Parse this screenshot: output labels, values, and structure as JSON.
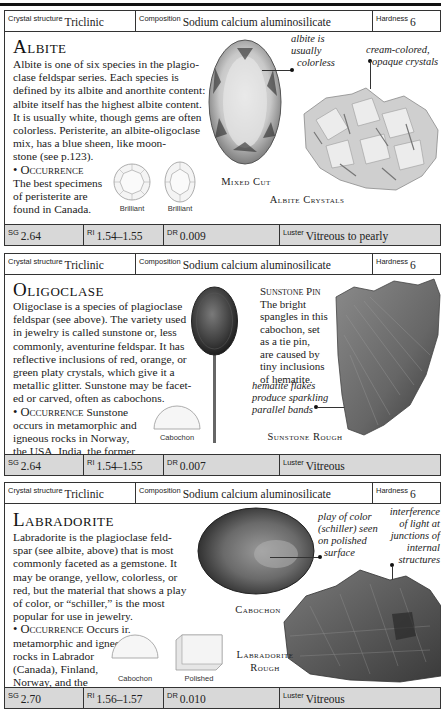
{
  "page": {
    "sections": [
      {
        "id": "albite",
        "title": "Albite",
        "header": {
          "crystal_structure_label": "Crystal structure",
          "crystal_structure": "Triclinic",
          "composition_label": "Composition",
          "composition": "Sodium calcium aluminosilicate",
          "hardness_label": "Hardness",
          "hardness": "6"
        },
        "body_lines": [
          "Albite is one of six species in the plagio-",
          "clase feldspar series. Each species is",
          "defined by its albite and anorthite content:",
          "albite itself has the highest albite content.",
          "It is usually white, though gems are often",
          "colorless. Peristerite, an albite-oligoclase",
          "mix, has a blue sheen, like moon-",
          "stone (see p.123)."
        ],
        "occurrence_label": "• Occurrence",
        "occurrence_lines": [
          "The best specimens",
          "of peristerite are",
          "found in Canada."
        ],
        "cut_labels": [
          "Brilliant",
          "Brilliant"
        ],
        "image_captions": [
          "Mixed Cut",
          "Albite Crystals"
        ],
        "annotations": [
          [
            "albite is",
            "usually",
            "colorless"
          ],
          [
            "cream-colored,",
            "opaque crystals"
          ]
        ],
        "footer": {
          "sg_label": "SG",
          "sg": "2.64",
          "ri_label": "RI",
          "ri": "1.54–1.55",
          "dr_label": "DR",
          "dr": "0.009",
          "luster_label": "Luster",
          "luster": "Vitreous to pearly"
        }
      },
      {
        "id": "oligoclase",
        "title": "Oligoclase",
        "header": {
          "crystal_structure_label": "Crystal structure",
          "crystal_structure": "Triclinic",
          "composition_label": "Composition",
          "composition": "Sodium calcium aluminosilicate",
          "hardness_label": "Hardness",
          "hardness": "6"
        },
        "body_lines": [
          "Oligoclase is a species of plagioclase",
          "feldspar (see above). The variety used",
          "in jewelry is called sunstone or, less",
          "commonly, aventurine feldspar. It has",
          "reflective inclusions of red, orange, or",
          "green platy crystals, which give it a",
          "metallic glitter. Sunstone may be facet-",
          "ed or carved, often as cabochons."
        ],
        "occurrence_label": "• Occurrence",
        "occurrence_first": "Sunstone",
        "occurrence_lines": [
          "occurs in metamorphic and",
          "igneous rocks in Norway,",
          "the USA, India, the former",
          "USSR, and Canada."
        ],
        "cut_labels": [
          "Cabochon"
        ],
        "side_caption_title": "Sunstone Pin",
        "side_caption_lines": [
          "The bright",
          "spangles in this",
          "cabochon, set",
          "as a tie pin,",
          "are caused by",
          "tiny inclusions",
          "of hematite."
        ],
        "image_captions": [
          "Sunstone Rough"
        ],
        "annotations": [
          [
            "hematite flakes",
            "produce sparkling",
            "parallel bands"
          ]
        ],
        "footer": {
          "sg_label": "SG",
          "sg": "2.64",
          "ri_label": "RI",
          "ri": "1.54–1.55",
          "dr_label": "DR",
          "dr": "0.007",
          "luster_label": "Luster",
          "luster": "Vitreous"
        }
      },
      {
        "id": "labradorite",
        "title": "Labradorite",
        "header": {
          "crystal_structure_label": "Crystal structure",
          "crystal_structure": "Triclinic",
          "composition_label": "Composition",
          "composition": "Sodium calcium aluminosilicate",
          "hardness_label": "Hardness",
          "hardness": "6"
        },
        "body_lines": [
          "Labradorite is the plagioclase feld-",
          "spar (see albite, above) that is most",
          "commonly faceted as a gemstone. It",
          "may be orange, yellow, colorless, or",
          "red, but the material that shows a play",
          "of color, or “schiller,” is the most",
          "popular for use in jewelry."
        ],
        "occurrence_label": "• Occurrence",
        "occurrence_first": "Occurs ir.",
        "occurrence_lines": [
          "metamorphic and igneous",
          "rocks in Labrador",
          "(Canada), Finland,",
          "Norway, and the",
          "former USSR."
        ],
        "cut_labels": [
          "Cabochon",
          "Polished"
        ],
        "image_captions": [
          "Cabochon",
          "Labradorite",
          "Rough"
        ],
        "annotations": [
          [
            "play of color",
            "(schiller) seen",
            "on polished",
            "surface"
          ],
          [
            "interference",
            "of light at",
            "junctions of",
            "internal",
            "structures"
          ]
        ],
        "footer": {
          "sg_label": "SG",
          "sg": "2.70",
          "ri_label": "RI",
          "ri": "1.56–1.57",
          "dr_label": "DR",
          "dr": "0.010",
          "luster_label": "Luster",
          "luster": "Vitreous"
        }
      }
    ]
  }
}
